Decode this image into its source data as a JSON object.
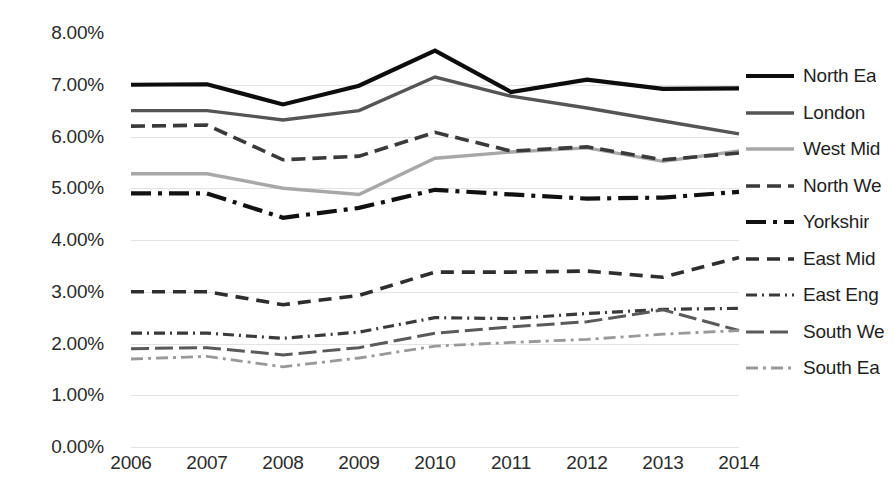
{
  "chart_data": {
    "type": "line",
    "title": "",
    "xlabel": "",
    "ylabel": "",
    "categories": [
      "2006",
      "2007",
      "2008",
      "2009",
      "2010",
      "2011",
      "2012",
      "2013",
      "2014"
    ],
    "x_tick_labels": [
      "2006",
      "2007",
      "2008",
      "2009",
      "2010",
      "2011",
      "2012",
      "2013",
      "2014"
    ],
    "y_tick_labels": [
      "8.00%",
      "7.00%",
      "6.00%",
      "5.00%",
      "4.00%",
      "3.00%",
      "2.00%",
      "1.00%",
      "0.00%"
    ],
    "y_tick_values": [
      8.0,
      7.0,
      6.0,
      5.0,
      4.0,
      3.0,
      2.0,
      1.0,
      0.0
    ],
    "ylim": [
      0.0,
      8.0
    ],
    "grid": true,
    "grid_axis": "y",
    "legend_position": "right",
    "series": [
      {
        "name": "North Ea",
        "legend_label": "North Ea",
        "style": "solid",
        "color": "#0d0d0d",
        "width": 4.2,
        "dash": "",
        "values": [
          7.0,
          7.01,
          6.62,
          6.98,
          7.66,
          6.86,
          7.1,
          6.92,
          6.93
        ]
      },
      {
        "name": "London",
        "legend_label": "London",
        "style": "solid-thin",
        "color": "#555555",
        "width": 3.4,
        "dash": "",
        "values": [
          6.5,
          6.5,
          6.32,
          6.5,
          7.15,
          6.78,
          6.55,
          6.3,
          6.05
        ]
      },
      {
        "name": "West Mid",
        "legend_label": "West Mid",
        "style": "solid-light",
        "color": "#a8a8a8",
        "width": 3.4,
        "dash": "",
        "values": [
          5.28,
          5.28,
          5.0,
          4.88,
          5.58,
          5.7,
          5.78,
          5.52,
          5.72
        ]
      },
      {
        "name": "North We",
        "legend_label": "North We",
        "style": "dashed",
        "color": "#3a3a3a",
        "width": 3.6,
        "dash": "14,7",
        "values": [
          6.2,
          6.22,
          5.55,
          5.62,
          6.08,
          5.72,
          5.8,
          5.55,
          5.68
        ]
      },
      {
        "name": "Yorkshir",
        "legend_label": "Yorkshir",
        "style": "dash-dot",
        "color": "#111111",
        "width": 4.2,
        "dash": "20,7,4,7",
        "values": [
          4.9,
          4.9,
          4.43,
          4.62,
          4.97,
          4.88,
          4.8,
          4.82,
          4.93
        ]
      },
      {
        "name": "East Mid",
        "legend_label": "East Mid",
        "style": "dashed-med",
        "color": "#2e2e2e",
        "width": 3.6,
        "dash": "13,8",
        "values": [
          3.0,
          3.0,
          2.75,
          2.93,
          3.38,
          3.38,
          3.4,
          3.28,
          3.66
        ]
      },
      {
        "name": "East Eng",
        "legend_label": "East Eng",
        "style": "dash-dot-dot",
        "color": "#3a3a3a",
        "width": 3.2,
        "dash": "11,5,2,5",
        "values": [
          2.2,
          2.2,
          2.1,
          2.22,
          2.5,
          2.48,
          2.58,
          2.66,
          2.68
        ]
      },
      {
        "name": "South We",
        "legend_label": "South We",
        "style": "dashed-fine",
        "color": "#5a5a5a",
        "width": 3.0,
        "dash": "18,6",
        "values": [
          1.9,
          1.92,
          1.78,
          1.92,
          2.2,
          2.32,
          2.42,
          2.65,
          2.25
        ]
      },
      {
        "name": "South Ea",
        "legend_label": "South Ea",
        "style": "dash-dot-light",
        "color": "#999999",
        "width": 2.8,
        "dash": "12,5,3,5",
        "values": [
          1.7,
          1.75,
          1.55,
          1.72,
          1.95,
          2.02,
          2.08,
          2.18,
          2.25
        ]
      }
    ]
  }
}
